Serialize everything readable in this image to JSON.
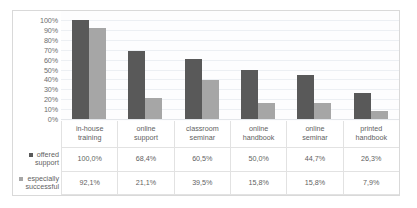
{
  "chart_data": {
    "type": "bar",
    "title": "",
    "subtitle": "",
    "xlabel": "",
    "ylabel": "",
    "ylim": [
      0,
      100
    ],
    "grid": true,
    "legend_position": "left-table",
    "categories": [
      "in-house\ntraining",
      "online\nsupport",
      "classroom\nseminar",
      "online\nhandbook",
      "online\nseminar",
      "printed\nhandbook"
    ],
    "y_ticks": [
      "100%",
      "90%",
      "80%",
      "70%",
      "60%",
      "50%",
      "40%",
      "30%",
      "20%",
      "10%",
      "0%"
    ],
    "series": [
      {
        "name": "offered\nsupport",
        "color": "#595959",
        "values": [
          100.0,
          68.4,
          60.5,
          50.0,
          44.7,
          26.3
        ],
        "labels": [
          "100,0%",
          "68,4%",
          "60,5%",
          "50,0%",
          "44,7%",
          "26,3%"
        ]
      },
      {
        "name": "especially\nsuccessful",
        "color": "#a6a6a6",
        "values": [
          92.1,
          21.1,
          39.5,
          15.8,
          15.8,
          7.9
        ],
        "labels": [
          "92,1%",
          "21,1%",
          "39,5%",
          "15,8%",
          "15,8%",
          "7,9%"
        ]
      }
    ]
  },
  "colors": {
    "series_offered_support": "#595959",
    "series_especially_successful": "#a6a6a6",
    "gridline": "#eceff3",
    "table_border": "#e2e2e2",
    "text": "#5f5f5f",
    "frame": "#d9d9d9"
  }
}
